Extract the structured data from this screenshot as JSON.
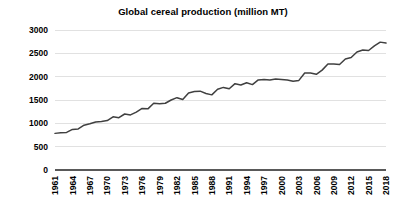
{
  "chart_data": {
    "type": "line",
    "title": "Global cereal production (million MT)",
    "xlabel": "",
    "ylabel": "",
    "ylim": [
      0,
      3000
    ],
    "ytick_values": [
      0,
      500,
      1000,
      1500,
      2000,
      2500,
      3000
    ],
    "ytick_labels": [
      "0",
      "500",
      "1000",
      "1500",
      "2000",
      "2500",
      "3000"
    ],
    "xlim": [
      1961,
      2018
    ],
    "xtick_labels": [
      "1961",
      "1964",
      "1967",
      "1970",
      "1973",
      "1976",
      "1979",
      "1982",
      "1985",
      "1988",
      "1991",
      "1994",
      "1997",
      "2000",
      "2003",
      "2006",
      "2009",
      "2012",
      "2015",
      "2018"
    ],
    "xtick_interval_years": 3,
    "grid": "horizontal",
    "legend": "none",
    "line_color": "#404040",
    "grid_color": "#d9d9d9",
    "axis_color": "#595959",
    "series": [
      {
        "name": "Global cereal production",
        "x": [
          1961,
          1962,
          1963,
          1964,
          1965,
          1966,
          1967,
          1968,
          1969,
          1970,
          1971,
          1972,
          1973,
          1974,
          1975,
          1976,
          1977,
          1978,
          1979,
          1980,
          1981,
          1982,
          1983,
          1984,
          1985,
          1986,
          1987,
          1988,
          1989,
          1990,
          1991,
          1992,
          1993,
          1994,
          1995,
          1996,
          1997,
          1998,
          1999,
          2000,
          2001,
          2002,
          2003,
          2004,
          2005,
          2006,
          2007,
          2008,
          2009,
          2010,
          2011,
          2012,
          2013,
          2014,
          2015,
          2016,
          2017,
          2018
        ],
        "values": [
          785,
          800,
          805,
          870,
          880,
          960,
          990,
          1030,
          1040,
          1060,
          1140,
          1120,
          1200,
          1180,
          1240,
          1320,
          1310,
          1430,
          1420,
          1430,
          1500,
          1550,
          1510,
          1650,
          1680,
          1690,
          1640,
          1610,
          1730,
          1770,
          1740,
          1850,
          1820,
          1870,
          1830,
          1930,
          1940,
          1930,
          1950,
          1940,
          1930,
          1900,
          1920,
          2080,
          2080,
          2050,
          2140,
          2270,
          2270,
          2260,
          2380,
          2410,
          2530,
          2570,
          2560,
          2660,
          2740,
          2720
        ]
      }
    ]
  }
}
